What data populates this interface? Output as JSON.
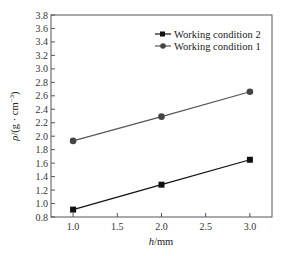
{
  "chart_data": {
    "type": "line",
    "title": "",
    "xlabel": "h/mm",
    "ylabel": "ρ/(g · cm⁻³)",
    "xlim": [
      0.75,
      3.25
    ],
    "ylim": [
      0.8,
      3.8
    ],
    "xticks": [
      1.0,
      1.5,
      2.0,
      2.5,
      3.0
    ],
    "xtick_labels": [
      "1.0",
      "1.5",
      "2.0",
      "2.5",
      "3.0"
    ],
    "yticks": [
      0.8,
      1.0,
      1.2,
      1.4,
      1.6,
      1.8,
      2.0,
      2.2,
      2.4,
      2.6,
      2.8,
      3.0,
      3.2,
      3.4,
      3.6,
      3.8
    ],
    "ytick_labels": [
      "0.8",
      "1.0",
      "1.2",
      "1.4",
      "1.6",
      "1.8",
      "2.0",
      "2.2",
      "2.4",
      "2.6",
      "2.8",
      "3.0",
      "3.2",
      "3.4",
      "3.6",
      "3.8"
    ],
    "grid": false,
    "legend_position": "upper right",
    "x": [
      1.0,
      2.0,
      3.0
    ],
    "series": [
      {
        "name": "Working condition 2",
        "marker": "square",
        "color": "#111111",
        "line_color": "#111111",
        "values": [
          0.91,
          1.28,
          1.65
        ]
      },
      {
        "name": "Working condition 1",
        "marker": "circle",
        "color": "#444444",
        "line_color": "#555555",
        "values": [
          1.93,
          2.29,
          2.66
        ]
      }
    ]
  },
  "axes": {
    "xlabel_italic": "h",
    "xlabel_unit": "/mm",
    "ylabel_italic": "ρ",
    "ylabel_unit": "/(g · cm",
    "ylabel_sup": "−3",
    "ylabel_close": ")"
  }
}
